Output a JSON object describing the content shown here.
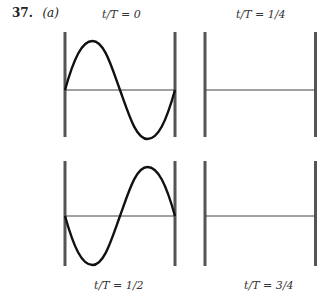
{
  "problem": {
    "number": "37.",
    "part": "(a)"
  },
  "panels": [
    {
      "id": "t0",
      "label": "t/T = 0",
      "wave": "sine-positive",
      "label_position": "top"
    },
    {
      "id": "t1_4",
      "label": "t/T = 1/4",
      "wave": "flat",
      "label_position": "top"
    },
    {
      "id": "t1_2",
      "label": "t/T = 1/2",
      "wave": "sine-negative",
      "label_position": "bottom"
    },
    {
      "id": "t3_4",
      "label": "t/T = 3/4",
      "wave": "flat",
      "label_position": "bottom"
    }
  ],
  "colors": {
    "wall": "#555555",
    "wave": "#111111",
    "axis": "#444444"
  }
}
